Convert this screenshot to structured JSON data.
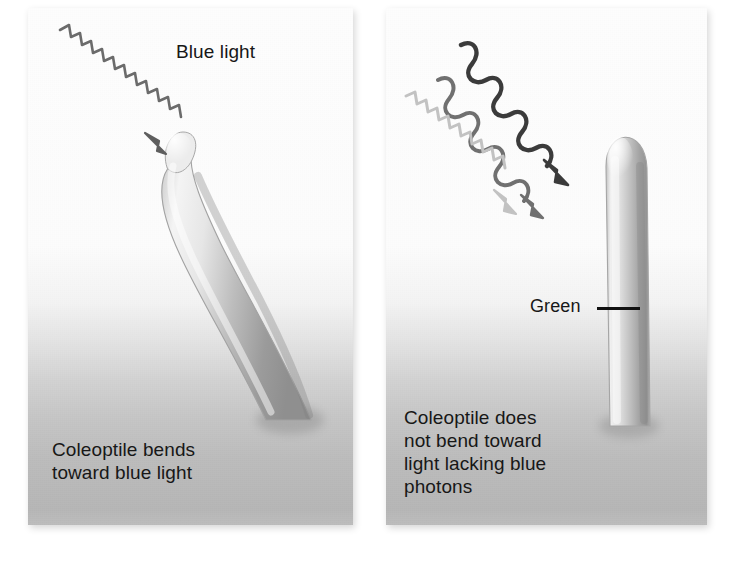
{
  "figure": {
    "type": "scientific-illustration",
    "background_color": "#ffffff"
  },
  "panels": [
    {
      "id": "left",
      "name": "blue-light-panel",
      "top_label": "Blue light",
      "caption": "Coleoptile bends\ntoward blue light",
      "light_beams": [
        {
          "name": "blue-light-beam",
          "style": "tight-zigzag",
          "color": "#6d6d6d",
          "arrow": true
        }
      ],
      "coleoptile": {
        "orientation": "bent-toward-upper-left",
        "tip_label": null
      }
    },
    {
      "id": "right",
      "name": "no-blue-light-panel",
      "top_label": "Light lacking blue\nphotons",
      "caption": "Coleoptile does\nnot bend toward\nlight lacking blue\nphotons",
      "callout_label": "Green",
      "light_beams": [
        {
          "name": "dark-wave-beam",
          "style": "smooth-wave",
          "color": "#3a3a3a",
          "arrow": true
        },
        {
          "name": "medium-wave-beam",
          "style": "smooth-wave",
          "color": "#6f6f6f",
          "arrow": true
        },
        {
          "name": "light-zigzag-beam",
          "style": "tight-zigzag",
          "color": "#bdbdbd",
          "arrow": true
        }
      ],
      "coleoptile": {
        "orientation": "upright-vertical",
        "tip_label": "Green"
      }
    }
  ],
  "colors": {
    "panel_top": "#fdfdfd",
    "panel_bottom": "#b6b6b6",
    "text": "#171717",
    "coleoptile_light": "#f2f2f2",
    "coleoptile_mid": "#b9b9b9",
    "coleoptile_dark": "#8d8d8d",
    "leader_line": "#111111"
  }
}
